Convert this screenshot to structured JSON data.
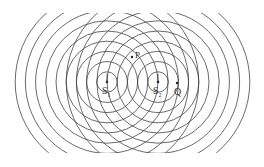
{
  "diagram": {
    "type": "two-source wave interference",
    "line_color": "#444444",
    "ring_spacing": 10.2,
    "ring_count": 9,
    "clip": {
      "x": 10,
      "y": 13,
      "width": 244,
      "height": 140
    },
    "sources": [
      {
        "id": "S1",
        "label": "S",
        "sub": "1",
        "x": 107,
        "y": 82
      },
      {
        "id": "S2",
        "label": "S",
        "sub": "2",
        "x": 158,
        "y": 82
      }
    ],
    "points": [
      {
        "id": "P",
        "label": "P",
        "x": 132,
        "y": 57
      },
      {
        "id": "Q",
        "label": "Q",
        "x": 177,
        "y": 83
      }
    ]
  }
}
